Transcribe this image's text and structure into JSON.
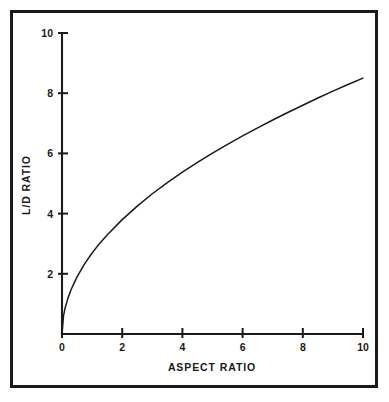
{
  "figure": {
    "background_color": "#ffffff",
    "frame_color": "#1a1a1a",
    "ink_color": "#1a1a1a"
  },
  "chart_data": {
    "type": "line",
    "title": "",
    "subtitle": "",
    "xlabel": "ASPECT RATIO",
    "ylabel": "L/D RATIO",
    "xlim": [
      0,
      10
    ],
    "ylim": [
      0,
      10
    ],
    "xticks": [
      0,
      2,
      4,
      6,
      8,
      10
    ],
    "yticks": [
      0,
      2,
      4,
      6,
      8,
      10
    ],
    "xtick_labels": [
      "0",
      "2",
      "4",
      "6",
      "8",
      "10"
    ],
    "ytick_labels": [
      "0",
      "2",
      "4",
      "6",
      "8",
      "10"
    ],
    "grid": false,
    "legend": null,
    "legend_position": "none",
    "annotations": [],
    "series": [
      {
        "name": "L/D RATIO vs ASPECT RATIO",
        "color": "#1a1a1a",
        "x": [
          0.0,
          0.05,
          0.1,
          0.2,
          0.3,
          0.5,
          0.75,
          1.0,
          1.25,
          1.5,
          2.0,
          2.5,
          3.0,
          3.5,
          4.0,
          4.5,
          5.0,
          5.5,
          6.0,
          6.5,
          7.0,
          7.5,
          8.0,
          8.5,
          9.0,
          9.5,
          10.0
        ],
        "y": [
          0.0,
          0.6,
          0.85,
          1.2,
          1.47,
          1.9,
          2.33,
          2.69,
          3.01,
          3.29,
          3.8,
          4.25,
          4.66,
          5.03,
          5.38,
          5.7,
          6.01,
          6.3,
          6.58,
          6.85,
          7.11,
          7.36,
          7.6,
          7.84,
          8.07,
          8.29,
          8.5
        ]
      }
    ]
  },
  "geometry": {
    "plot_left_px": 62,
    "plot_right_px": 363,
    "plot_bottom_px": 334,
    "plot_top_px": 33
  }
}
